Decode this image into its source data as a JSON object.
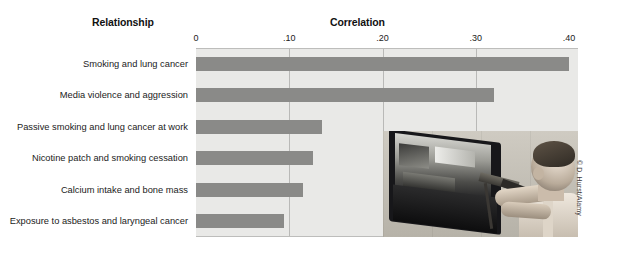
{
  "figure": {
    "column_headers": {
      "relationship": "Relationship",
      "correlation": "Correlation"
    },
    "credit": "© D. Hurst/Alamy",
    "photo": {
      "alt_name": "child-playing-light-gun-video-game"
    }
  },
  "chart_data": {
    "type": "bar",
    "orientation": "horizontal",
    "title": "Correlation",
    "xlabel": "Correlation",
    "ylabel": "Relationship",
    "xlim": [
      0,
      0.4
    ],
    "grid": true,
    "legend": null,
    "tick_labels": [
      "0",
      ".10",
      ".20",
      ".30",
      ".40"
    ],
    "tick_values": [
      0,
      0.1,
      0.2,
      0.3,
      0.4
    ],
    "categories": [
      "Smoking and lung cancer",
      "Media violence and aggression",
      "Passive smoking and lung cancer at work",
      "Nicotine patch and smoking cessation",
      "Calcium intake and bone mass",
      "Exposure to asbestos and laryngeal cancer"
    ],
    "values": [
      0.4,
      0.32,
      0.135,
      0.125,
      0.115,
      0.094
    ],
    "bar_color": "#8a8a88",
    "plot_background": "#e9e9e7"
  }
}
